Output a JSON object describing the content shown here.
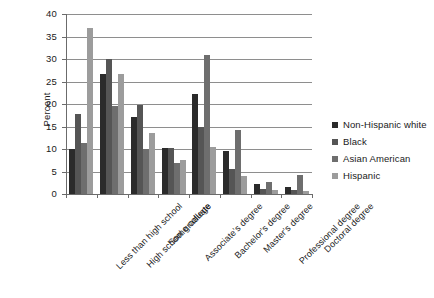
{
  "chart_data": {
    "type": "bar",
    "title": "",
    "xlabel": "",
    "ylabel": "Percent",
    "ylim": [
      0,
      40
    ],
    "ytick_step": 5,
    "ytick_labels": [
      "40",
      "35",
      "30",
      "25",
      "20",
      "15",
      "10",
      "5",
      "0"
    ],
    "grid": "horizontal",
    "legend_position": "right",
    "categories": [
      "Less than high school",
      "High school graduate",
      "Some college",
      "Associate's degree",
      "Bachelor's degree",
      "Master's degree",
      "Professional degree",
      "Doctoral degree"
    ],
    "series": [
      {
        "name": "Non-Hispanic white",
        "color": "#2b2b2b",
        "values": [
          10.0,
          26.7,
          17.2,
          10.3,
          22.3,
          9.6,
          2.2,
          1.6
        ]
      },
      {
        "name": "Black",
        "color": "#555555",
        "values": [
          17.7,
          30.0,
          19.7,
          10.3,
          14.8,
          5.6,
          1.2,
          0.8
        ]
      },
      {
        "name": "Asian American",
        "color": "#6e6e6e",
        "values": [
          11.3,
          19.6,
          10.0,
          7.0,
          31.0,
          14.3,
          2.6,
          4.2
        ]
      },
      {
        "name": "Hispanic",
        "color": "#9c9c9c",
        "values": [
          36.9,
          26.6,
          13.6,
          7.5,
          10.5,
          4.0,
          1.0,
          0.7
        ]
      }
    ]
  },
  "legend": {
    "items": [
      {
        "label": "Non-Hispanic white",
        "color": "#2b2b2b"
      },
      {
        "label": "Black",
        "color": "#555555"
      },
      {
        "label": "Asian American",
        "color": "#6e6e6e"
      },
      {
        "label": "Hispanic",
        "color": "#9c9c9c"
      }
    ]
  },
  "colors": {
    "axis": "#6b6b6b",
    "grid": "#8e8e8e",
    "text": "#1a1a1a",
    "background": "#ffffff"
  }
}
